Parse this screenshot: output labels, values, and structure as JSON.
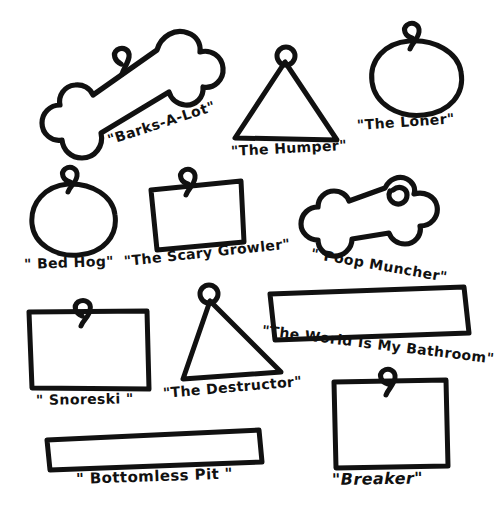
{
  "page": {
    "background_color": "#ffffff",
    "ink_color": "#111111",
    "width": 486,
    "height": 524,
    "style": "hand-drawn black ink line art on white"
  },
  "tags": [
    {
      "id": "barks-a-lot",
      "label": "\"Barks-A-Lot\"",
      "shape": "bone",
      "ring": "loop",
      "position": {
        "x": 40,
        "y": 20,
        "w": 180,
        "h": 130
      },
      "rotation_deg": -18
    },
    {
      "id": "the-humper",
      "label": "\"The Humper\"",
      "shape": "triangle",
      "ring": "loop",
      "position": {
        "x": 228,
        "y": 45,
        "w": 112,
        "h": 95
      },
      "rotation_deg": -3
    },
    {
      "id": "the-loner",
      "label": "\"The Loner\"",
      "shape": "circle",
      "ring": "loop",
      "position": {
        "x": 352,
        "y": 22,
        "w": 110,
        "h": 95
      },
      "rotation_deg": -4
    },
    {
      "id": "bed-hog",
      "label": "\" Bed Hog\"",
      "shape": "circle",
      "ring": "loop",
      "position": {
        "x": 22,
        "y": 168,
        "w": 100,
        "h": 90
      },
      "rotation_deg": -2
    },
    {
      "id": "the-scary-growler",
      "label": "\"The Scary Growler\"",
      "shape": "square",
      "ring": "loop",
      "position": {
        "x": 147,
        "y": 175,
        "w": 97,
        "h": 82
      },
      "rotation_deg": -6
    },
    {
      "id": "poop-muncher",
      "label": "\" Poop Muncher\"",
      "shape": "bone",
      "ring": "loop",
      "position": {
        "x": 316,
        "y": 175,
        "w": 150,
        "h": 80
      },
      "rotation_deg": 10
    },
    {
      "id": "snoreski",
      "label": "\" Snoreski \"",
      "shape": "rectangle",
      "ring": "loop",
      "position": {
        "x": 28,
        "y": 308,
        "w": 120,
        "h": 82
      },
      "rotation_deg": -1
    },
    {
      "id": "the-destructor",
      "label": "\"The Destructor\"",
      "shape": "triangle",
      "ring": "loop",
      "position": {
        "x": 176,
        "y": 295,
        "w": 100,
        "h": 88
      },
      "rotation_deg": -5
    },
    {
      "id": "the-world-is-my-bathroom",
      "label": "\"The World Is My Bathroom\"",
      "shape": "long-rectangle",
      "ring": "none",
      "position": {
        "x": 268,
        "y": 288,
        "w": 195,
        "h": 46
      },
      "rotation_deg": 7
    },
    {
      "id": "bottomless-pit",
      "label": "\" Bottomless Pit \"",
      "shape": "long-rectangle",
      "ring": "none",
      "position": {
        "x": 45,
        "y": 428,
        "w": 215,
        "h": 40
      },
      "rotation_deg": -2
    },
    {
      "id": "breaker",
      "label": "\"Breaker\"",
      "shape": "square",
      "ring": "loop",
      "position": {
        "x": 332,
        "y": 378,
        "w": 115,
        "h": 90
      },
      "rotation_deg": -1
    }
  ]
}
